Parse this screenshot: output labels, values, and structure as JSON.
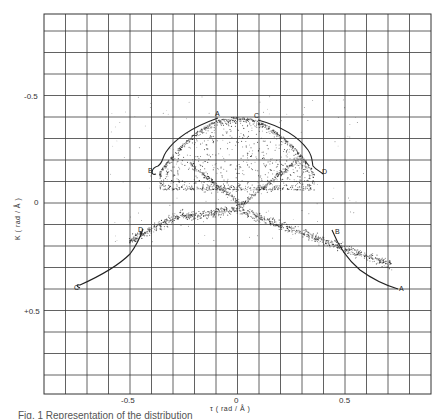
{
  "chart_data": {
    "type": "scatter",
    "title": "",
    "xlabel": "τ (rad / Å)",
    "ylabel": "K (rad / Å)",
    "xlim": [
      -0.9,
      0.9
    ],
    "ylim": [
      0.9,
      -0.88
    ],
    "y_axis_inverted": true,
    "grid": true,
    "grid_spacing": 0.1,
    "x_ticks": [
      {
        "value": -0.5,
        "label": "-0.5"
      },
      {
        "value": 0,
        "label": "0"
      },
      {
        "value": 0.5,
        "label": "0.5"
      }
    ],
    "y_ticks": [
      {
        "value": -0.5,
        "label": "-0.5"
      },
      {
        "value": 0,
        "label": "0"
      },
      {
        "value": 0.5,
        "label": "+0.5"
      }
    ],
    "legend": null,
    "series": [
      {
        "name": "point distribution (upper lobe)",
        "description": "dense dot cloud forming an arch between τ≈-0.35 and τ≈0.35, κ from ≈-0.45 down to ≈0",
        "approx_extent": {
          "tau": [
            -0.35,
            0.35
          ],
          "kappa": [
            -0.45,
            0.02
          ]
        }
      },
      {
        "name": "point distribution (lower band)",
        "description": "dot band forming an inverted V through (0, 0.05), reaching (-0.45, 0.15) and (0.7, 0.4)",
        "approx_extent": {
          "tau": [
            -0.5,
            0.72
          ],
          "kappa": [
            -0.05,
            0.42
          ]
        }
      }
    ],
    "curves": [
      {
        "name": "upper-left B-A",
        "start_label": "B",
        "end_label": "A",
        "points": [
          [
            -0.37,
            -0.15
          ],
          [
            -0.345,
            -0.2
          ],
          [
            -0.265,
            -0.3
          ],
          [
            -0.15,
            -0.375
          ],
          [
            -0.09,
            -0.395
          ]
        ]
      },
      {
        "name": "upper-right C-D",
        "start_label": "C",
        "end_label": "D",
        "points": [
          [
            0.1,
            -0.385
          ],
          [
            0.22,
            -0.34
          ],
          [
            0.32,
            -0.27
          ],
          [
            0.35,
            -0.2
          ],
          [
            0.38,
            -0.145
          ]
        ]
      },
      {
        "name": "lower-left C-D",
        "start_label": "C",
        "end_label": "D",
        "points": [
          [
            -0.735,
            0.395
          ],
          [
            -0.64,
            0.335
          ],
          [
            -0.52,
            0.255
          ],
          [
            -0.46,
            0.18
          ],
          [
            -0.44,
            0.125
          ]
        ]
      },
      {
        "name": "lower-right B-A",
        "start_label": "B",
        "end_label": "A",
        "points": [
          [
            0.44,
            0.125
          ],
          [
            0.5,
            0.24
          ],
          [
            0.57,
            0.32
          ],
          [
            0.69,
            0.38
          ],
          [
            0.75,
            0.4
          ]
        ]
      }
    ],
    "annotations": [
      {
        "text": "A",
        "tau": -0.09,
        "kappa": -0.41
      },
      {
        "text": "B",
        "tau": -0.4,
        "kappa": -0.155
      },
      {
        "text": "C",
        "tau": 0.09,
        "kappa": -0.4
      },
      {
        "text": "D",
        "tau": 0.4,
        "kappa": -0.15
      },
      {
        "text": "D",
        "tau": -0.45,
        "kappa": 0.12
      },
      {
        "text": "C",
        "tau": -0.75,
        "kappa": 0.385
      },
      {
        "text": "B",
        "tau": 0.45,
        "kappa": 0.135
      },
      {
        "text": "A",
        "tau": 0.76,
        "kappa": 0.395
      }
    ]
  },
  "axes": {
    "xlabel": "τ ( rad / Å )",
    "ylabel": "K ( rad / Å )",
    "x_tick_labels": [
      "-0.5",
      "0",
      "0.5"
    ],
    "y_tick_labels": [
      "-0.5",
      "0",
      "+0.5"
    ]
  },
  "labels": {
    "ul_A": "A",
    "ul_B": "B",
    "ur_C": "C",
    "ur_D": "D",
    "ll_D": "D",
    "ll_C": "C",
    "lr_B": "B",
    "lr_A": "A"
  },
  "caption": "Fig. 1  Representation of the distribution"
}
